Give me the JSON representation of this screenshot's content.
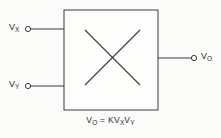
{
  "diagram": {
    "type": "circuit-block-diagram",
    "background_color": "#fbfbfa",
    "line_color": "#3a3a3a",
    "text_color": "#2b2b2b",
    "block": {
      "name": "multiplier-block",
      "shape": "square",
      "inner_symbol": "x-cross",
      "fill": "#fdfdfc",
      "x": 64,
      "y": 10,
      "width": 94,
      "height": 100
    },
    "inputs": [
      {
        "id": "input-vx",
        "label_base": "V",
        "label_sub": "X",
        "label_full": "VX",
        "terminal": "open-circle",
        "terminal_x": 28,
        "terminal_y": 29,
        "wire_y": 29
      },
      {
        "id": "input-vy",
        "label_base": "V",
        "label_sub": "Y",
        "label_full": "VY",
        "terminal": "open-circle",
        "terminal_x": 28,
        "terminal_y": 86,
        "wire_y": 86
      }
    ],
    "outputs": [
      {
        "id": "output-vo",
        "label_base": "V",
        "label_sub": "O",
        "label_full": "VO",
        "terminal": "open-circle",
        "terminal_x": 194,
        "terminal_y": 58,
        "wire_y": 58
      }
    ],
    "equation": {
      "parts": {
        "lhs_base": "V",
        "lhs_sub": "O",
        "operator": "=",
        "gain": "K",
        "term1_base": "V",
        "term1_sub": "X",
        "term2_base": "V",
        "term2_sub": "Y"
      },
      "plain_text": "VO = K VX VY"
    }
  }
}
